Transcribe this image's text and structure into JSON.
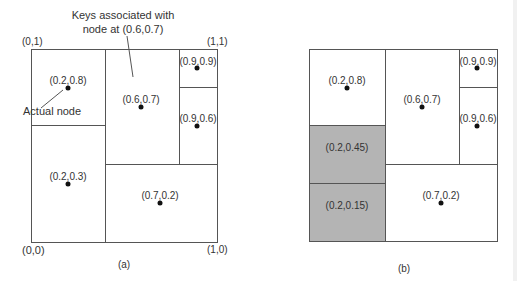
{
  "panel_a": {
    "caption": "(a)",
    "callouts": {
      "keys_line1": "Keys associated with",
      "keys_line2": "node at (0.6,0.7)",
      "actual_node": "Actual node"
    },
    "corners": {
      "top_left": "(0,1)",
      "top_right": "(1,1)",
      "bottom_left": "(0,0)",
      "bottom_right": "(1,0)"
    },
    "points": [
      {
        "label": "(0.2,0.8)"
      },
      {
        "label": "(0.6,0.7)"
      },
      {
        "label": "(0.9,0.9)"
      },
      {
        "label": "(0.9,0.6)"
      },
      {
        "label": "(0.2,0.3)"
      },
      {
        "label": "(0.7,0.2)"
      }
    ]
  },
  "panel_b": {
    "caption": "(b)",
    "points": [
      {
        "label": "(0.2,0.8)"
      },
      {
        "label": "(0.6,0.7)"
      },
      {
        "label": "(0.9,0.9)"
      },
      {
        "label": "(0.9,0.6)"
      },
      {
        "label": "(0.7,0.2)"
      }
    ],
    "shaded_cells": [
      {
        "label": "(0.2,0.45)"
      },
      {
        "label": "(0.2,0.15)"
      }
    ]
  },
  "colors": {
    "line": "#555555",
    "shade": "#b4b4b4",
    "dot": "#111111",
    "text": "#333333"
  }
}
